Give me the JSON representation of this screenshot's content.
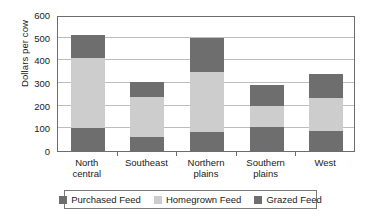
{
  "chart_data": {
    "type": "bar",
    "subtype": "stacked-bar",
    "title": "",
    "xlabel": "",
    "ylabel": "Dollars per cow",
    "ylim": [
      0,
      600
    ],
    "yticks": [
      0,
      100,
      200,
      300,
      400,
      500,
      600
    ],
    "ytick_labels": [
      "0",
      "100",
      "200",
      "300",
      "400",
      "500",
      "600"
    ],
    "grid": true,
    "grid_axis": "y",
    "legend_position": "bottom",
    "categories": [
      "North central",
      "Southeast",
      "Northern plains",
      "Southern plains",
      "West"
    ],
    "category_lines": [
      [
        "North",
        "central"
      ],
      [
        "Southeast",
        ""
      ],
      [
        "Northern",
        "plains"
      ],
      [
        "Southern",
        "plains"
      ],
      [
        "West",
        ""
      ]
    ],
    "series": [
      {
        "name": "Purchased Feed",
        "color": "#6e6e6e",
        "values": [
          100,
          60,
          85,
          105,
          90
        ]
      },
      {
        "name": "Homegrown Feed",
        "color": "#cdcdcd",
        "values": [
          310,
          180,
          265,
          95,
          145
        ]
      },
      {
        "name": "Grazed Feed",
        "color": "#6e6e6e",
        "values": [
          100,
          65,
          150,
          90,
          105
        ]
      }
    ],
    "totals": [
      510,
      305,
      500,
      290,
      340
    ],
    "colors": {
      "purchased_feed": "#6e6e6e",
      "homegrown_feed": "#cdcdcd",
      "grazed_feed": "#6e6e6e",
      "axis": "#6d6d6d",
      "gridline": "#bdbdbd",
      "text": "#1a1a1a",
      "background": "#ffffff"
    }
  },
  "axis": {
    "y_title": "Dollars per cow"
  },
  "legend": {
    "items": [
      {
        "label": "Purchased Feed",
        "color": "#6e6e6e"
      },
      {
        "label": "Homegrown Feed",
        "color": "#cdcdcd"
      },
      {
        "label": "Grazed Feed",
        "color": "#6e6e6e"
      }
    ]
  }
}
